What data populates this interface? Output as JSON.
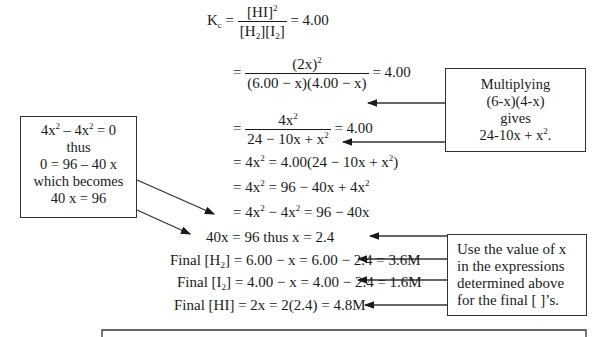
{
  "equations": {
    "line1": {
      "lhs": "K",
      "lhs_sub": "c",
      "num": "[HI]",
      "num_sup": "2",
      "den_a": "[H",
      "den_a_sub": "2",
      "den_b": "][I",
      "den_b_sub": "2",
      "den_c": "]",
      "rhs": "= 4.00"
    },
    "line2": {
      "prefix": "=",
      "num": "(2x)",
      "num_sup": "2",
      "den": "(6.00 − x)(4.00 − x)",
      "rhs": "= 4.00"
    },
    "line3": {
      "prefix": "=",
      "num": "4x",
      "num_sup": "2",
      "den": "24 − 10x + x",
      "den_sup": "2",
      "rhs": "= 4.00"
    },
    "line4": {
      "a": "= 4x",
      "a_sup": "2",
      "b": " = 4.00(24 − 10x + x",
      "b_sup": "2",
      "c": ")"
    },
    "line5": {
      "a": "= 4x",
      "a_sup": "2",
      "b": " = 96 − 40x + 4x",
      "b_sup": "2"
    },
    "line6": {
      "a": "= 4x",
      "a_sup": "2",
      "b": " − 4x",
      "b_sup": "2",
      "c": " = 96 − 40x"
    },
    "line7": {
      "text": "40x = 96 thus x = 2.4"
    },
    "line8": {
      "label": "Final [H",
      "sub": "2",
      "rest": "] = 6.00 − x = 6.00 − 2.4 = 3.6M"
    },
    "line9": {
      "label": "Final [I",
      "sub": "2",
      "rest": "] = 4.00 − x = 4.00 − 2.4 = 1.6M"
    },
    "line10": {
      "text": "Final [HI] = 2x = 2(2.4) = 4.8M"
    }
  },
  "callouts": {
    "left": {
      "line1_a": "4x",
      "line1_sup_a": "2",
      "line1_b": " – 4x",
      "line1_sup_b": "2",
      "line1_c": " = 0",
      "line2": "thus",
      "line3": "0 = 96 – 40 x",
      "line4": "which becomes",
      "line5": "40 x = 96"
    },
    "right_top": {
      "line1": "Multiplying",
      "line2": "(6-x)(4-x)",
      "line3": "gives",
      "line4": "24-10x + x",
      "line4_sup": "2",
      "line4_end": "."
    },
    "right_bottom": {
      "line1": "Use the value of x",
      "line2": "in the expressions",
      "line3": "determined above",
      "line4": "for the final [ ]’s."
    }
  }
}
